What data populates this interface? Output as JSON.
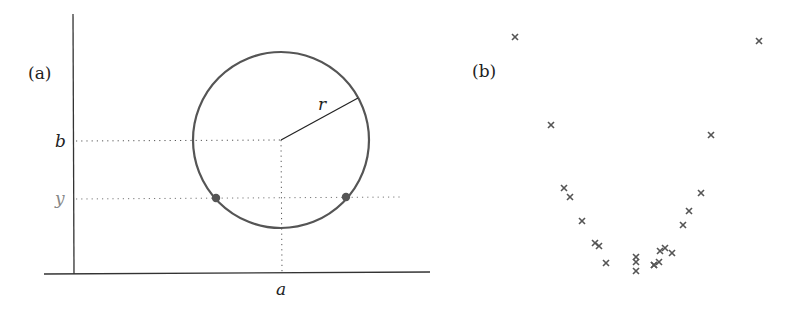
{
  "panel_a": {
    "label": "(a)",
    "axis_labels": {
      "x": "a",
      "y1": "b",
      "y2": "y"
    },
    "radius_label": "r",
    "circle": {
      "cx": 281,
      "cy": 140,
      "r": 88
    },
    "intersection_points": [
      {
        "x": 216,
        "y": 198
      },
      {
        "x": 346,
        "y": 198
      }
    ],
    "colors": {
      "circle": "#555555",
      "point": "#555555",
      "y_label": "#888888"
    }
  },
  "panel_b": {
    "label": "(b)",
    "marker": "x",
    "points": [
      [
        515,
        37
      ],
      [
        759,
        41
      ],
      [
        551,
        125
      ],
      [
        711,
        135
      ],
      [
        564,
        188
      ],
      [
        570,
        197
      ],
      [
        582,
        221
      ],
      [
        701,
        193
      ],
      [
        689,
        211
      ],
      [
        683,
        225
      ],
      [
        595,
        243
      ],
      [
        599,
        246
      ],
      [
        606,
        263
      ],
      [
        636,
        257
      ],
      [
        636,
        262
      ],
      [
        636,
        271
      ],
      [
        654,
        265
      ],
      [
        659,
        262
      ],
      [
        660,
        251
      ],
      [
        665,
        248
      ],
      [
        672,
        253
      ],
      [
        654,
        265
      ]
    ]
  }
}
